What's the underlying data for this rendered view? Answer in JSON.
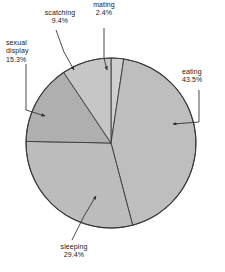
{
  "chart_data": {
    "type": "pie",
    "title": "",
    "subtitle": "",
    "xlabel": "",
    "ylabel": "",
    "legend_position": "none",
    "grid": false,
    "labels_position": "outside-with-leader-lines",
    "value_unit": "percent",
    "categories": [
      "mating",
      "eating",
      "sleeping",
      "sexual display",
      "scratching"
    ],
    "values": [
      2.4,
      43.5,
      29.4,
      15.3,
      9.4
    ],
    "slices": [
      {
        "name": "mating",
        "label": "mating",
        "value": 2.4,
        "value_text": "2.4%",
        "color": "#cfcfcf",
        "start_angle": 0.0,
        "end_angle": 8.64
      },
      {
        "name": "eating",
        "label": "eating",
        "value": 43.5,
        "value_text": "43.5%",
        "color": "#bebebe",
        "start_angle": 8.64,
        "end_angle": 165.24
      },
      {
        "name": "sleeping",
        "label": "sleeping",
        "value": 29.4,
        "value_text": "29.4%",
        "color": "#bcbcbc",
        "start_angle": 165.24,
        "end_angle": 271.08
      },
      {
        "name": "sexual display",
        "label": "sexual display",
        "value": 15.3,
        "value_text": "15.3%",
        "color": "#afafaf",
        "start_angle": 271.08,
        "end_angle": 326.16
      },
      {
        "name": "scratching",
        "label": "scatching",
        "value": 9.4,
        "value_text": "9.4%",
        "color": "#c6c6c6",
        "start_angle": 326.16,
        "end_angle": 360.0
      }
    ]
  },
  "figure": {
    "background_color": "#ffffff",
    "outline_color": "#3a3a3a",
    "leader_line_color": "#2b2b2b",
    "text_color": "#1a1a1a",
    "center_x": 111,
    "center_y": 143,
    "radius": 85
  },
  "labels": {
    "scratching": {
      "name": "scatching",
      "pct": "9.4%"
    },
    "mating": {
      "name": "mating",
      "pct": "2.4%"
    },
    "sexual_display": {
      "name_line1": "sexual",
      "name_line2": "display",
      "pct": "15.3%"
    },
    "eating": {
      "name": "eating",
      "pct": "43.5%"
    },
    "sleeping": {
      "name": "sleeping",
      "pct": "29.4%"
    }
  }
}
